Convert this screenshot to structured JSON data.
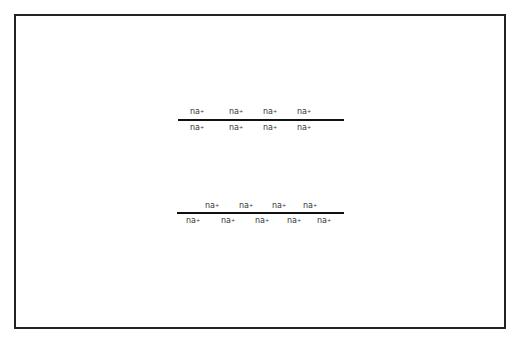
{
  "diagram": {
    "row1": {
      "top_labels": [
        {
          "text": "na",
          "sup": "+",
          "x": 197
        },
        {
          "text": "na",
          "sup": "+",
          "x": 236
        },
        {
          "text": "na",
          "sup": "+",
          "x": 270
        },
        {
          "text": "na",
          "sup": "+",
          "x": 304
        }
      ],
      "bottom_labels": [
        {
          "text": "na",
          "sup": "+",
          "x": 197
        },
        {
          "text": "na",
          "sup": "+",
          "x": 236
        },
        {
          "text": "na",
          "sup": "+",
          "x": 270
        },
        {
          "text": "na",
          "sup": "+",
          "x": 304
        }
      ]
    },
    "row2": {
      "top_labels": [
        {
          "text": "na",
          "sup": "+",
          "x": 212
        },
        {
          "text": "na",
          "sup": "+",
          "x": 246
        },
        {
          "text": "na",
          "sup": "+",
          "x": 279
        },
        {
          "text": "na",
          "sup": "+",
          "x": 310
        }
      ],
      "bottom_labels": [
        {
          "text": "na",
          "sup": "+",
          "x": 193
        },
        {
          "text": "na",
          "sup": "+",
          "x": 228
        },
        {
          "text": "na",
          "sup": "+",
          "x": 262
        },
        {
          "text": "na",
          "sup": "+",
          "x": 294
        },
        {
          "text": "na",
          "sup": "+",
          "x": 324
        }
      ]
    }
  }
}
